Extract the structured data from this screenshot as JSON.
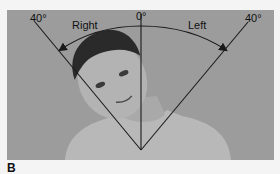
{
  "figure": {
    "panel_label": "B",
    "labels": {
      "left_angle": "40°",
      "center_angle": "0°",
      "right_angle": "40°",
      "direction_right": "Right",
      "direction_left": "Left"
    },
    "colors": {
      "background": "#9c9c9c",
      "line": "#1a1a1a",
      "page": "#f4f4f4"
    }
  }
}
